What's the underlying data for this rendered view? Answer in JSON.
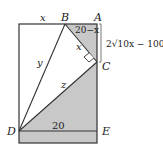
{
  "diagram": {
    "points": {
      "A": "A",
      "B": "B",
      "C": "C",
      "D": "D",
      "E": "E"
    },
    "labels": {
      "top_left_segment": "x",
      "BA_segment": "20−x",
      "BC_segment": "x",
      "BD_segment": "y",
      "DC_segment": "z",
      "DE_segment": "20",
      "AC_length": "2√10x − 100"
    },
    "colors": {
      "shade": "#c8c8c8",
      "line": "#333333",
      "background": "#ffffff"
    }
  }
}
